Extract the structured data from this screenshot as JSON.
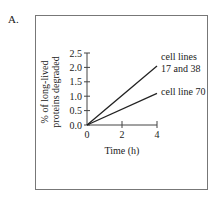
{
  "panel_label": "A.",
  "chart_data": {
    "type": "line",
    "title": "",
    "xlabel": "Time (h)",
    "ylabel_lines": [
      "% of long-lived",
      "proteins degraded"
    ],
    "ylabel": "% of long-lived proteins degraded",
    "xlim": [
      0,
      4
    ],
    "ylim": [
      0,
      2.5
    ],
    "x_ticks": [
      0,
      2,
      4
    ],
    "x_tick_labels": [
      "0",
      "2",
      "4"
    ],
    "y_ticks": [
      0,
      0.5,
      1.0,
      1.5,
      2.0,
      2.5
    ],
    "y_tick_labels": [
      "0.0",
      "0.5",
      "1.0",
      "1.5",
      "2.0",
      "2.5"
    ],
    "grid": false,
    "legend": "inline-right",
    "series": [
      {
        "name": "cell lines 17 and 38",
        "label_lines": [
          "cell lines",
          "17 and 38"
        ],
        "x": [
          0,
          4
        ],
        "y": [
          0,
          2.05
        ],
        "color": "#222222"
      },
      {
        "name": "cell line 70",
        "label_lines": [
          "cell line 70"
        ],
        "x": [
          0,
          4
        ],
        "y": [
          0,
          1.1
        ],
        "color": "#222222"
      }
    ]
  }
}
